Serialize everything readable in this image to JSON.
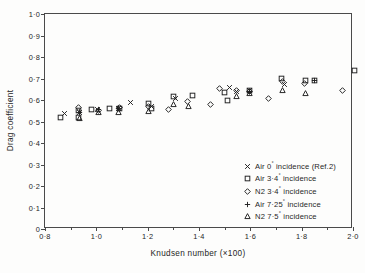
{
  "figure": {
    "background_color": "#ffffff",
    "ink_color": "#1f1f1f",
    "axis_color": "#4a4a4a"
  },
  "axes": {
    "y_title": "Drag coefficient",
    "x_title": "Knudsen number (×100)",
    "y_ticks": [
      "0",
      "0·1",
      "0·2",
      "0·3",
      "0·4",
      "0·5",
      "0·6",
      "0·7",
      "0·8",
      "0·9",
      "1·0"
    ],
    "x_ticks_major": [
      "0·8",
      "1·0",
      "1·2",
      "1·4",
      "1·6",
      "1·8",
      "2·0"
    ]
  },
  "legend": {
    "entries": [
      {
        "marker": "cross-marker",
        "label": "Air 0° incidence (Ref.2)"
      },
      {
        "marker": "square-marker",
        "label": "Air 3·4° incidence"
      },
      {
        "marker": "diamond-marker",
        "label": "N2 3·4° incidence"
      },
      {
        "marker": "plus-marker",
        "label": "Air 7·25° incidence"
      },
      {
        "marker": "triangle-marker",
        "label": "N2 7·5° incidence"
      }
    ]
  },
  "chart_data": {
    "type": "scatter",
    "title": "",
    "xlabel": "Knudsen number (×100)",
    "ylabel": "Drag coefficient",
    "xlim": [
      0.8,
      2.0
    ],
    "ylim": [
      0.0,
      1.0
    ],
    "x_tick_step_major": 0.2,
    "x_tick_step_minor": 0.1,
    "y_tick_step": 0.1,
    "grid": false,
    "legend_position": "lower-right-inside",
    "series": [
      {
        "name": "Air 0° incidence (Ref.2)",
        "marker": "x",
        "points": [
          [
            0.875,
            0.537
          ],
          [
            0.935,
            0.543
          ],
          [
            1.005,
            0.557
          ],
          [
            1.085,
            0.562
          ],
          [
            1.135,
            0.59
          ],
          [
            1.215,
            0.572
          ],
          [
            1.31,
            0.608
          ],
          [
            1.52,
            0.658
          ],
          [
            1.545,
            0.64
          ],
          [
            1.595,
            0.642
          ],
          [
            1.735,
            0.67
          ]
        ]
      },
      {
        "name": "Air 3·4° incidence",
        "marker": "square",
        "points": [
          [
            0.862,
            0.518
          ],
          [
            0.93,
            0.52
          ],
          [
            0.93,
            0.553
          ],
          [
            0.982,
            0.556
          ],
          [
            1.053,
            0.56
          ],
          [
            1.09,
            0.562
          ],
          [
            1.205,
            0.582
          ],
          [
            1.215,
            0.562
          ],
          [
            1.3,
            0.615
          ],
          [
            1.375,
            0.622
          ],
          [
            1.5,
            0.635
          ],
          [
            1.51,
            0.6
          ],
          [
            1.595,
            0.645
          ],
          [
            1.72,
            0.7
          ],
          [
            1.815,
            0.69
          ],
          [
            1.85,
            0.692
          ],
          [
            2.005,
            0.735
          ]
        ]
      },
      {
        "name": "N2 3·4° incidence",
        "marker": "diamond",
        "points": [
          [
            0.93,
            0.565
          ],
          [
            1.01,
            0.55
          ],
          [
            1.09,
            0.563
          ],
          [
            1.205,
            0.57
          ],
          [
            1.28,
            0.555
          ],
          [
            1.355,
            0.592
          ],
          [
            1.445,
            0.58
          ],
          [
            1.48,
            0.655
          ],
          [
            1.545,
            0.645
          ],
          [
            1.595,
            0.64
          ],
          [
            1.67,
            0.605
          ],
          [
            1.725,
            0.688
          ],
          [
            1.81,
            0.678
          ],
          [
            1.96,
            0.645
          ]
        ]
      },
      {
        "name": "Air 7·25° incidence",
        "marker": "plus",
        "points": [
          [
            0.933,
            0.54
          ],
          [
            1.01,
            0.558
          ],
          [
            1.088,
            0.56
          ],
          [
            1.595,
            0.64
          ],
          [
            1.85,
            0.69
          ]
        ]
      },
      {
        "name": "N2 7·5° incidence",
        "marker": "triangle",
        "points": [
          [
            0.935,
            0.515
          ],
          [
            1.01,
            0.54
          ],
          [
            1.088,
            0.543
          ],
          [
            1.205,
            0.548
          ],
          [
            1.3,
            0.578
          ],
          [
            1.36,
            0.572
          ],
          [
            1.545,
            0.615
          ],
          [
            1.595,
            0.632
          ],
          [
            1.725,
            0.645
          ],
          [
            1.815,
            0.63
          ]
        ]
      }
    ]
  }
}
